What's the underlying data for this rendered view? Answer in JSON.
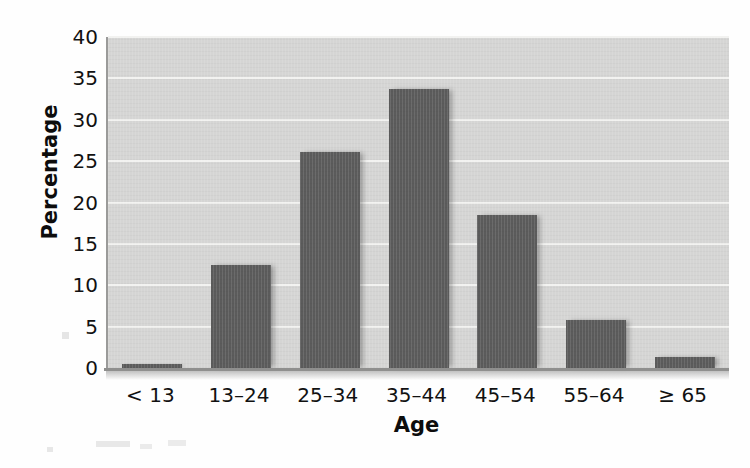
{
  "chart_data": {
    "type": "bar",
    "title": "",
    "subtitle": "",
    "xlabel": "Age",
    "ylabel": "Percentage",
    "categories": [
      "< 13",
      "13–24",
      "25–34",
      "35–44",
      "45–54",
      "55–64",
      "≥ 65"
    ],
    "values": [
      0.3,
      12.4,
      26.1,
      33.7,
      18.5,
      5.8,
      1.3
    ],
    "ylim": [
      0,
      40
    ],
    "ytick_labels": [
      "0",
      "5",
      "10",
      "15",
      "20",
      "25",
      "30",
      "35",
      "40"
    ],
    "ytick_values": [
      0,
      5,
      10,
      15,
      20,
      25,
      30,
      35,
      40
    ],
    "grid": true,
    "grid_axis": "y",
    "legend": false,
    "legend_position": "none",
    "bar_color": "#5b5b5b",
    "plot_background": "#d5d5d4",
    "gridline_color": "#f2f2f0",
    "axis_color": "#8f8f8e",
    "text_color": "#111111"
  }
}
